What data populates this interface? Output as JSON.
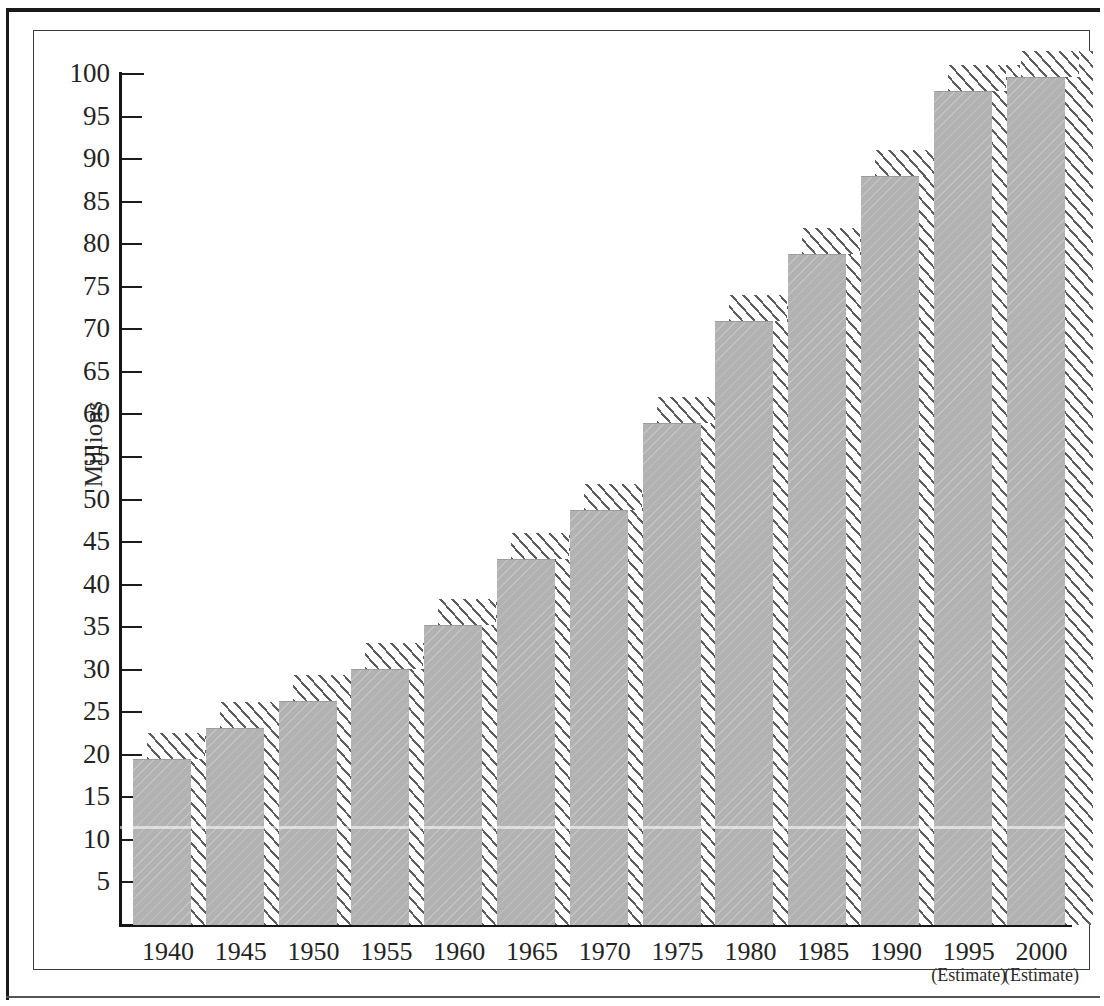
{
  "figure": {
    "y_axis_title": "Millions",
    "bar_fill_color": "#b2b2b2",
    "hatch_color": "#5d5d5d",
    "axis_color": "#151515"
  },
  "y_ticks": [
    {
      "label": "100",
      "value": 100
    },
    {
      "label": "95",
      "value": 95
    },
    {
      "label": "90",
      "value": 90
    },
    {
      "label": "85",
      "value": 85
    },
    {
      "label": "80",
      "value": 80
    },
    {
      "label": "75",
      "value": 75
    },
    {
      "label": "70",
      "value": 70
    },
    {
      "label": "65",
      "value": 65
    },
    {
      "label": "60",
      "value": 60
    },
    {
      "label": "55",
      "value": 55
    },
    {
      "label": "50",
      "value": 50
    },
    {
      "label": "45",
      "value": 45
    },
    {
      "label": "40",
      "value": 40
    },
    {
      "label": "35",
      "value": 35
    },
    {
      "label": "30",
      "value": 30
    },
    {
      "label": "25",
      "value": 25
    },
    {
      "label": "20",
      "value": 20
    },
    {
      "label": "15",
      "value": 15
    },
    {
      "label": "10",
      "value": 10
    },
    {
      "label": "5",
      "value": 5
    }
  ],
  "x_labels": [
    {
      "year": "1940",
      "note": ""
    },
    {
      "year": "1945",
      "note": ""
    },
    {
      "year": "1950",
      "note": ""
    },
    {
      "year": "1955",
      "note": ""
    },
    {
      "year": "1960",
      "note": ""
    },
    {
      "year": "1965",
      "note": ""
    },
    {
      "year": "1970",
      "note": ""
    },
    {
      "year": "1975",
      "note": ""
    },
    {
      "year": "1980",
      "note": ""
    },
    {
      "year": "1985",
      "note": ""
    },
    {
      "year": "1990",
      "note": ""
    },
    {
      "year": "1995",
      "note": "(Estimate)"
    },
    {
      "year": "2000",
      "note": "(Estimate)"
    }
  ],
  "chart_data": {
    "type": "bar",
    "title": "",
    "subtitle": "",
    "xlabel": "",
    "ylabel": "Millions",
    "categories": [
      "1940",
      "1945",
      "1950",
      "1955",
      "1960",
      "1965",
      "1970",
      "1975",
      "1980",
      "1985",
      "1990",
      "1995",
      "2000"
    ],
    "values": [
      19.5,
      23.2,
      26.3,
      30.1,
      35.2,
      43.0,
      48.8,
      59.0,
      71.0,
      78.8,
      88.0,
      98.0,
      99.6
    ],
    "ylim": [
      0,
      100
    ],
    "ytick_step": 5,
    "grid": false,
    "legend": null,
    "annotations": [
      {
        "category": "1995",
        "text": "(Estimate)"
      },
      {
        "category": "2000",
        "text": "(Estimate)"
      }
    ],
    "style": "3d-shaded-bars-with-hatched-top-and-side-faces"
  }
}
